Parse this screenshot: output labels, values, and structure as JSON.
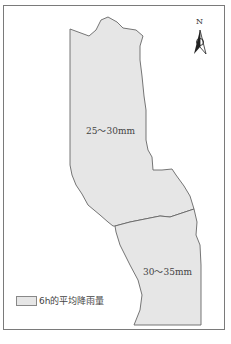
{
  "map": {
    "regions": [
      {
        "name": "north-region",
        "label": "25～30mm",
        "fill": "#e6e6e6"
      },
      {
        "name": "south-region",
        "label": "30～35mm",
        "fill": "#e6e6e6"
      }
    ],
    "north_arrow": {
      "label": "N"
    },
    "legend": {
      "label": "6h的平均降雨量",
      "swatch_color": "#e6e6e6"
    },
    "border_color": "#7a7a7a",
    "outline_color": "#666666"
  }
}
